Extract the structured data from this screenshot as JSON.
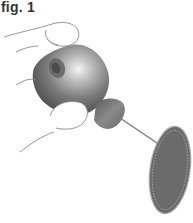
{
  "figure": {
    "label": "fig. 1",
    "icons": [
      "hand-icon",
      "hearing-aid-icon",
      "filter-disc-icon"
    ]
  },
  "colors": {
    "text": "#333333",
    "outline": "#7a7a7a",
    "device_dark": "#4a4a4a",
    "device_mid": "#7d7d7d",
    "device_highlight": "#f2f2f2",
    "disc_fill": "#6b6b6b",
    "disc_rim": "#a9a9a9",
    "wire": "#7a7a7a"
  }
}
